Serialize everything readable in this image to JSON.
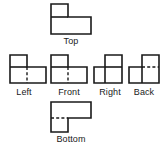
{
  "figure": {
    "background_color": "#ffffff",
    "line_color": "#1a1a1a",
    "views": [
      {
        "id": "top",
        "label": "Top",
        "row": "upper",
        "outline": "L-shape: narrow square upper-left, wide rectangle across bottom",
        "hidden_lines": 0
      },
      {
        "id": "left",
        "label": "Left",
        "row": "middle",
        "outline": "L-shape: tall block on left, low step extending right",
        "hidden_lines": 1,
        "hidden_line_orientation": "vertical"
      },
      {
        "id": "front",
        "label": "Front",
        "row": "middle",
        "outline": "L-shape: tall block on left, low step extending right",
        "hidden_lines": 1,
        "hidden_line_orientation": "vertical"
      },
      {
        "id": "right",
        "label": "Right",
        "row": "middle",
        "outline": "L-shape mirrored: low step on left, tall block on right",
        "hidden_lines": 0
      },
      {
        "id": "back",
        "label": "Back",
        "row": "middle",
        "outline": "L-shape mirrored: low step on left, tall block on right",
        "hidden_lines": 1,
        "hidden_line_orientation": "horizontal"
      },
      {
        "id": "bottom",
        "label": "Bottom",
        "row": "lower",
        "outline": "L-shape: wide rectangle across top, narrow block below left",
        "hidden_lines": 1,
        "hidden_line_orientation": "horizontal"
      }
    ]
  }
}
